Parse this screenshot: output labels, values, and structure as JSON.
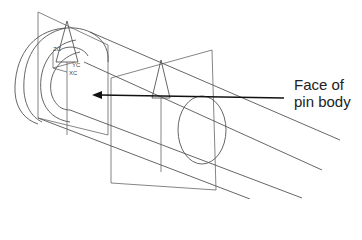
{
  "callout": {
    "line1": "Face of",
    "line2": "pin body"
  },
  "axes": {
    "zc": "ZC",
    "yc": "YC",
    "xc": "XC"
  },
  "colors": {
    "lines": "#555555",
    "arrow": "#111111",
    "text": "#222222"
  }
}
